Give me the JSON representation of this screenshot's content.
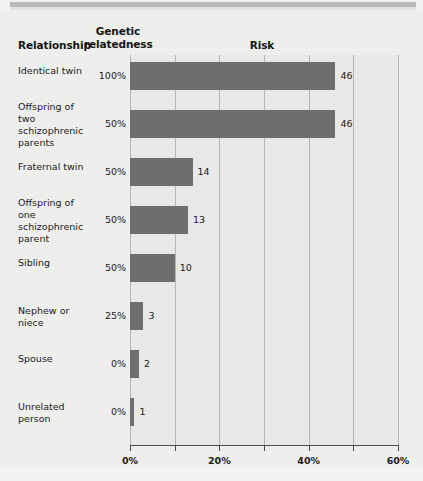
{
  "headers": {
    "relationship": "Relationship",
    "genetic_relatedness": "Genetic relatedness",
    "genetic_line1": "Genetic",
    "genetic_line2": "relatedness",
    "risk": "Risk"
  },
  "chart_data": {
    "type": "bar",
    "orientation": "horizontal",
    "title": "Risk",
    "xlabel": "",
    "ylabel": "",
    "xlim": [
      0,
      60
    ],
    "xticks": [
      0,
      10,
      20,
      30,
      40,
      50,
      60
    ],
    "xtick_labels": [
      "0%",
      "",
      "20%",
      "",
      "40%",
      "",
      "60%"
    ],
    "grid": true,
    "grid_axis": "x",
    "legend": false,
    "bar_color": "#6e6e6e",
    "categories": [
      "Identical twin",
      "Offspring of two schizophrenic parents",
      "Fraternal twin",
      "Offspring of one schizophrenic parent",
      "Sibling",
      "Nephew or niece",
      "Spouse",
      "Unrelated person"
    ],
    "values": [
      46,
      46,
      14,
      13,
      10,
      3,
      2,
      1
    ],
    "value_labels": [
      "46",
      "46",
      "14",
      "13",
      "10",
      "3",
      "2",
      "1"
    ],
    "genetic_relatedness": [
      "100%",
      "50%",
      "50%",
      "50%",
      "50%",
      "25%",
      "0%",
      "0%"
    ]
  },
  "rows": [
    {
      "label": "Identical twin",
      "label_lines": [
        "Identical twin"
      ],
      "relatedness": "100%",
      "value": 46,
      "value_label": "46"
    },
    {
      "label": "Offspring of two schizophrenic parents",
      "label_lines": [
        "Offspring of two",
        "schizophrenic",
        "parents"
      ],
      "relatedness": "50%",
      "value": 46,
      "value_label": "46"
    },
    {
      "label": "Fraternal twin",
      "label_lines": [
        "Fraternal twin"
      ],
      "relatedness": "50%",
      "value": 14,
      "value_label": "14"
    },
    {
      "label": "Offspring of one schizophrenic parent",
      "label_lines": [
        "Offspring of one",
        "schizophrenic",
        "parent"
      ],
      "relatedness": "50%",
      "value": 13,
      "value_label": "13"
    },
    {
      "label": "Sibling",
      "label_lines": [
        "Sibling"
      ],
      "relatedness": "50%",
      "value": 10,
      "value_label": "10"
    },
    {
      "label": "Nephew or niece",
      "label_lines": [
        "Nephew or niece"
      ],
      "relatedness": "25%",
      "value": 3,
      "value_label": "3"
    },
    {
      "label": "Spouse",
      "label_lines": [
        "Spouse"
      ],
      "relatedness": "0%",
      "value": 2,
      "value_label": "2"
    },
    {
      "label": "Unrelated person",
      "label_lines": [
        "Unrelated person"
      ],
      "relatedness": "0%",
      "value": 1,
      "value_label": "1"
    }
  ],
  "axis": {
    "ticks": [
      {
        "value": 0,
        "label": "0%",
        "major": true
      },
      {
        "value": 10,
        "label": "",
        "major": false
      },
      {
        "value": 20,
        "label": "20%",
        "major": true
      },
      {
        "value": 30,
        "label": "",
        "major": false
      },
      {
        "value": 40,
        "label": "40%",
        "major": true
      },
      {
        "value": 50,
        "label": "",
        "major": false
      },
      {
        "value": 60,
        "label": "60%",
        "major": true
      }
    ]
  },
  "colors": {
    "bar": "#6e6e6e",
    "plot_background": "#e8e8e6",
    "page_background": "#eeeeec",
    "gridline": "#b5b5b3",
    "axis": "#4a4a4a",
    "top_band": "#b9b9b9"
  }
}
